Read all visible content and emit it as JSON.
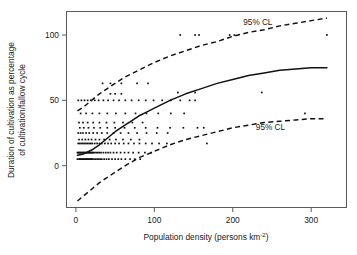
{
  "chart_data": {
    "type": "scatter",
    "title": "",
    "subtitle": "",
    "xlabel": "Population density (persons km",
    "xlabel_sup": "-2",
    "xlabel_tail": ")",
    "xlabel_full": "Population density (persons km-2)",
    "ylabel_line1": "Duration of cultivation as percentage",
    "ylabel_line2": "of cultivation/fallow cycle",
    "ylabel_full": "Duration of cultivation as percentage of cultivation/fallow cycle",
    "xlim": [
      -12,
      345
    ],
    "ylim": [
      -32,
      118
    ],
    "xticks": [
      0,
      100,
      200,
      300
    ],
    "xtick_labels": [
      "0",
      "100",
      "200",
      "300"
    ],
    "yticks": [
      0,
      50,
      100
    ],
    "ytick_labels": [
      "0",
      "50",
      "100"
    ],
    "grid": false,
    "legend_position": "none",
    "point_color": "#111111",
    "line_color": "#111111",
    "frame_color": "#5a5a5a",
    "annotations": [
      {
        "text": "95% CL",
        "x": 232,
        "y": 108,
        "name": "upper-confidence-label"
      },
      {
        "text": "95% CL",
        "x": 248,
        "y": 27,
        "name": "lower-confidence-label"
      }
    ],
    "series": [
      {
        "name": "observations",
        "type": "scatter",
        "marker": "point",
        "points": [
          [
            2,
            5
          ],
          [
            4,
            5
          ],
          [
            5,
            5
          ],
          [
            6,
            5
          ],
          [
            7,
            5
          ],
          [
            8,
            5
          ],
          [
            9,
            5
          ],
          [
            10,
            5
          ],
          [
            11,
            5
          ],
          [
            12,
            5
          ],
          [
            13,
            5
          ],
          [
            14,
            5
          ],
          [
            15,
            5
          ],
          [
            16,
            5
          ],
          [
            17,
            5
          ],
          [
            18,
            5
          ],
          [
            19,
            5
          ],
          [
            20,
            5
          ],
          [
            21,
            5
          ],
          [
            23,
            5
          ],
          [
            25,
            5
          ],
          [
            27,
            5
          ],
          [
            29,
            5
          ],
          [
            31,
            5
          ],
          [
            33,
            5
          ],
          [
            36,
            5
          ],
          [
            39,
            5
          ],
          [
            42,
            5
          ],
          [
            46,
            5
          ],
          [
            50,
            5
          ],
          [
            54,
            5
          ],
          [
            58,
            5
          ],
          [
            63,
            5
          ],
          [
            69,
            5
          ],
          [
            75,
            5
          ],
          [
            82,
            5
          ],
          [
            2,
            10
          ],
          [
            3,
            10
          ],
          [
            4,
            10
          ],
          [
            5,
            10
          ],
          [
            6,
            10
          ],
          [
            7,
            10
          ],
          [
            8,
            10
          ],
          [
            9,
            10
          ],
          [
            10,
            10
          ],
          [
            11,
            10
          ],
          [
            12,
            10
          ],
          [
            13,
            10
          ],
          [
            14,
            10
          ],
          [
            15,
            10
          ],
          [
            16,
            10
          ],
          [
            17,
            10
          ],
          [
            18,
            10
          ],
          [
            19,
            10
          ],
          [
            20,
            10
          ],
          [
            21,
            10
          ],
          [
            22,
            10
          ],
          [
            24,
            10
          ],
          [
            26,
            10
          ],
          [
            28,
            10
          ],
          [
            30,
            10
          ],
          [
            32,
            10
          ],
          [
            35,
            10
          ],
          [
            38,
            10
          ],
          [
            41,
            10
          ],
          [
            44,
            10
          ],
          [
            48,
            10
          ],
          [
            52,
            10
          ],
          [
            57,
            10
          ],
          [
            62,
            10
          ],
          [
            67,
            10
          ],
          [
            73,
            10
          ],
          [
            80,
            10
          ],
          [
            88,
            10
          ],
          [
            96,
            10
          ],
          [
            3,
            17
          ],
          [
            5,
            17
          ],
          [
            7,
            17
          ],
          [
            9,
            17
          ],
          [
            11,
            17
          ],
          [
            13,
            17
          ],
          [
            15,
            17
          ],
          [
            17,
            17
          ],
          [
            19,
            17
          ],
          [
            21,
            17
          ],
          [
            24,
            17
          ],
          [
            27,
            17
          ],
          [
            30,
            17
          ],
          [
            33,
            17
          ],
          [
            37,
            17
          ],
          [
            41,
            17
          ],
          [
            45,
            17
          ],
          [
            50,
            17
          ],
          [
            55,
            17
          ],
          [
            61,
            17
          ],
          [
            67,
            17
          ],
          [
            74,
            17
          ],
          [
            81,
            17
          ],
          [
            89,
            17
          ],
          [
            97,
            17
          ],
          [
            106,
            17
          ],
          [
            116,
            17
          ],
          [
            167,
            17
          ],
          [
            4,
            20
          ],
          [
            8,
            20
          ],
          [
            12,
            20
          ],
          [
            16,
            20
          ],
          [
            20,
            20
          ],
          [
            25,
            20
          ],
          [
            30,
            20
          ],
          [
            36,
            20
          ],
          [
            43,
            20
          ],
          [
            51,
            20
          ],
          [
            60,
            20
          ],
          [
            70,
            20
          ],
          [
            81,
            20
          ],
          [
            3,
            25
          ],
          [
            6,
            25
          ],
          [
            9,
            25
          ],
          [
            13,
            25
          ],
          [
            17,
            25
          ],
          [
            22,
            25
          ],
          [
            27,
            25
          ],
          [
            33,
            25
          ],
          [
            40,
            25
          ],
          [
            48,
            25
          ],
          [
            57,
            25
          ],
          [
            67,
            25
          ],
          [
            78,
            25
          ],
          [
            90,
            25
          ],
          [
            103,
            25
          ],
          [
            117,
            25
          ],
          [
            5,
            29
          ],
          [
            10,
            29
          ],
          [
            16,
            29
          ],
          [
            23,
            29
          ],
          [
            31,
            29
          ],
          [
            40,
            29
          ],
          [
            50,
            29
          ],
          [
            62,
            29
          ],
          [
            75,
            29
          ],
          [
            89,
            29
          ],
          [
            104,
            29
          ],
          [
            120,
            29
          ],
          [
            137,
            29
          ],
          [
            155,
            29
          ],
          [
            163,
            29
          ],
          [
            4,
            33
          ],
          [
            9,
            33
          ],
          [
            15,
            33
          ],
          [
            22,
            33
          ],
          [
            30,
            33
          ],
          [
            39,
            33
          ],
          [
            49,
            33
          ],
          [
            60,
            33
          ],
          [
            72,
            33
          ],
          [
            85,
            33
          ],
          [
            6,
            40
          ],
          [
            13,
            40
          ],
          [
            21,
            40
          ],
          [
            30,
            40
          ],
          [
            40,
            40
          ],
          [
            51,
            40
          ],
          [
            63,
            40
          ],
          [
            76,
            40
          ],
          [
            90,
            40
          ],
          [
            105,
            40
          ],
          [
            121,
            40
          ],
          [
            138,
            40
          ],
          [
            292,
            40
          ],
          [
            3,
            50
          ],
          [
            7,
            50
          ],
          [
            11,
            50
          ],
          [
            15,
            50
          ],
          [
            19,
            50
          ],
          [
            24,
            50
          ],
          [
            29,
            50
          ],
          [
            35,
            50
          ],
          [
            41,
            50
          ],
          [
            48,
            50
          ],
          [
            55,
            50
          ],
          [
            63,
            50
          ],
          [
            71,
            50
          ],
          [
            80,
            50
          ],
          [
            89,
            50
          ],
          [
            99,
            50
          ],
          [
            110,
            50
          ],
          [
            121,
            50
          ],
          [
            133,
            50
          ],
          [
            145,
            50
          ],
          [
            152,
            50
          ],
          [
            44,
            55
          ],
          [
            50,
            55
          ],
          [
            58,
            55
          ],
          [
            130,
            56
          ],
          [
            152,
            56
          ],
          [
            237,
            56
          ],
          [
            34,
            63
          ],
          [
            44,
            63
          ],
          [
            58,
            63
          ],
          [
            78,
            63
          ],
          [
            92,
            63
          ],
          [
            133,
            100
          ],
          [
            152,
            100
          ],
          [
            157,
            100
          ],
          [
            196,
            100
          ],
          [
            202,
            100
          ],
          [
            320,
            100
          ]
        ]
      },
      {
        "name": "fitted-logistic-curve",
        "type": "line",
        "style": "solid",
        "x": [
          2,
          10,
          20,
          30,
          40,
          50,
          60,
          70,
          80,
          90,
          100,
          120,
          140,
          160,
          180,
          200,
          220,
          240,
          260,
          280,
          300,
          320
        ],
        "y": [
          8,
          9,
          12,
          16,
          21,
          26,
          30,
          34,
          38,
          41,
          44,
          50,
          55,
          59,
          63,
          66,
          69,
          71,
          73,
          74,
          75,
          75
        ]
      },
      {
        "name": "upper-95-confidence-limit",
        "type": "line",
        "style": "dashed",
        "x": [
          2,
          10,
          20,
          30,
          40,
          50,
          60,
          70,
          80,
          100,
          120,
          140,
          160,
          180,
          200,
          220,
          240,
          260,
          280,
          300,
          320
        ],
        "y": [
          42,
          45,
          50,
          55,
          59,
          63,
          67,
          70,
          73,
          79,
          84,
          88,
          92,
          95,
          99,
          102,
          104,
          107,
          109,
          111,
          113
        ]
      },
      {
        "name": "lower-95-confidence-limit",
        "type": "line",
        "style": "dashed",
        "x": [
          2,
          10,
          20,
          30,
          40,
          50,
          60,
          80,
          100,
          120,
          140,
          160,
          180,
          200,
          220,
          240,
          260,
          280,
          300,
          320
        ],
        "y": [
          -27,
          -23,
          -18,
          -13,
          -9,
          -5,
          -1,
          6,
          11,
          16,
          20,
          23,
          26,
          29,
          31,
          33,
          34,
          35,
          36,
          36
        ]
      }
    ]
  }
}
